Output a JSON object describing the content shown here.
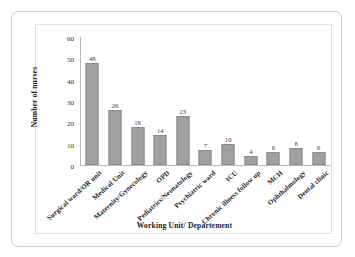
{
  "top_remnant": "",
  "chart_data": {
    "type": "bar",
    "title": "",
    "xlabel": "Working Unit/ Departement",
    "ylabel": "Number of nurses",
    "categories": [
      "Surgical ward/OR unit",
      "Medical Unit",
      "Maternity/Gynecology",
      "OPD",
      "Pediatrics/Neonatology",
      "Psychiatric ward",
      "ICU",
      "Chronic illness follow up",
      "MCH",
      "Ophthalmology",
      "Dental clinic"
    ],
    "values": [
      48,
      26,
      18,
      14,
      23,
      7,
      10,
      4,
      6,
      8,
      6
    ],
    "ylim": [
      0,
      60
    ],
    "yticks": [
      0,
      10,
      20,
      30,
      40,
      50,
      60
    ],
    "grid": false,
    "legend": "none",
    "bar_color": "#a0a0a0",
    "bar_border_color": "#8a8a8a",
    "axis_color": "#b8b8b8",
    "data_labels_shown": true
  }
}
